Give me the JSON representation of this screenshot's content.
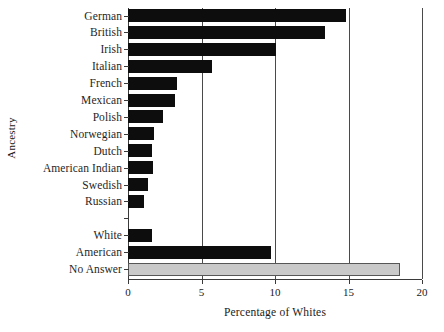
{
  "chart_data": {
    "type": "bar",
    "orientation": "horizontal",
    "title": "",
    "xlabel": "Percentage of Whites",
    "ylabel": "Ancestry",
    "xlim": [
      0,
      20
    ],
    "xticks": [
      0,
      5,
      10,
      15,
      20
    ],
    "xtick_labels": [
      "0",
      "5",
      "10",
      "15",
      "20"
    ],
    "grid": "vertical",
    "legend": "none",
    "categories": [
      "German",
      "British",
      "Irish",
      "Italian",
      "French",
      "Mexican",
      "Polish",
      "Norwegian",
      "Dutch",
      "American Indian",
      "Swedish",
      "Russian",
      "",
      "White",
      "American",
      "No Answer"
    ],
    "values": [
      14.8,
      13.4,
      10.1,
      5.7,
      3.3,
      3.2,
      2.4,
      1.8,
      1.6,
      1.7,
      1.35,
      1.1,
      0,
      1.6,
      9.7,
      18.5
    ],
    "bar_colors": [
      "#0d0d0d",
      "#0d0d0d",
      "#0d0d0d",
      "#0d0d0d",
      "#0d0d0d",
      "#0d0d0d",
      "#0d0d0d",
      "#0d0d0d",
      "#0d0d0d",
      "#0d0d0d",
      "#0d0d0d",
      "#0d0d0d",
      "none",
      "#0d0d0d",
      "#0d0d0d",
      "#c9c9c9"
    ],
    "colors": {
      "bar_dark": "#0d0d0d",
      "bar_gray": "#c9c9c9",
      "gray_border": "#565656",
      "axis": "#3a3a3a",
      "grid": "#4a4a4a",
      "text": "#1f1f1f",
      "background": "#ffffff"
    }
  }
}
